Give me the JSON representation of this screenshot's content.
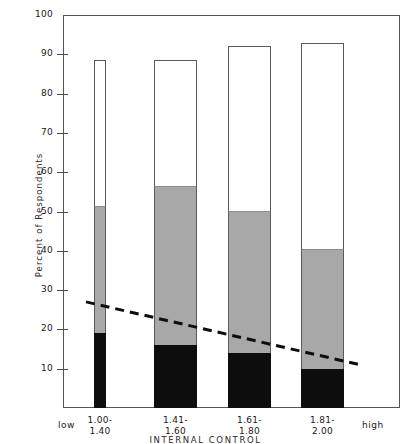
{
  "chart_data": {
    "type": "bar",
    "subtype": "stacked-bar-with-trendline",
    "title": "",
    "xlabel": "INTERNAL CONTROL",
    "ylabel": "Percent of Respondents",
    "ylim": [
      0,
      100
    ],
    "ytick_values": [
      10,
      20,
      30,
      40,
      50,
      60,
      70,
      80,
      90,
      100
    ],
    "ytick_labels": [
      "10",
      "20",
      "30",
      "40",
      "50",
      "60",
      "70",
      "80",
      "90",
      "100"
    ],
    "grid": false,
    "legend": "none",
    "categories": [
      "1.00-\n1.40",
      "1.41-\n1.60",
      "1.61-\n1.80",
      "1.81-\n2.00"
    ],
    "x_axis_end_labels": {
      "left": "low",
      "right": "high"
    },
    "series": [
      {
        "name": "black-segment",
        "color": "#0d0d0d",
        "values": [
          19,
          16,
          14,
          10
        ]
      },
      {
        "name": "gray-segment",
        "color": "#a8a8a8",
        "values": [
          32.5,
          40.5,
          36,
          30.5
        ]
      },
      {
        "name": "white-segment",
        "color": "#ffffff",
        "values": [
          37,
          32,
          42,
          52.5
        ]
      }
    ],
    "cumulative_tops": {
      "black": [
        19,
        16,
        14,
        10
      ],
      "gray": [
        51.5,
        56.5,
        50,
        40.5
      ],
      "white": [
        88.5,
        88.5,
        92,
        93
      ]
    },
    "trendline": {
      "style": "dashed",
      "color": "#0d0d0d",
      "x_start_category": "1.00-1.40",
      "x_end_category": "1.81-2.00",
      "y_start": 27,
      "y_end": 11
    }
  },
  "axis": {
    "y_title": "Percent of Respondents",
    "x_title": "INTERNAL CONTROL",
    "y_ticks": [
      {
        "label": "100",
        "value": 100
      },
      {
        "label": "90",
        "value": 90
      },
      {
        "label": "80",
        "value": 80
      },
      {
        "label": "70",
        "value": 70
      },
      {
        "label": "60",
        "value": 60
      },
      {
        "label": "50",
        "value": 50
      },
      {
        "label": "40",
        "value": 40
      },
      {
        "label": "30",
        "value": 30
      },
      {
        "label": "20",
        "value": 20
      },
      {
        "label": "10",
        "value": 10
      }
    ],
    "x_labels": [
      {
        "line1": "1.00-",
        "line2": "1.40"
      },
      {
        "line1": "1.41-",
        "line2": "1.60"
      },
      {
        "line1": "1.61-",
        "line2": "1.80"
      },
      {
        "line1": "1.81-",
        "line2": "2.00"
      }
    ],
    "x_low_label": "low",
    "x_high_label": "high"
  },
  "colors": {
    "black_segment": "#0d0d0d",
    "gray_segment": "#a8a8a8",
    "white_segment": "#ffffff",
    "axis": "#555555",
    "trendline": "#0d0d0d"
  }
}
